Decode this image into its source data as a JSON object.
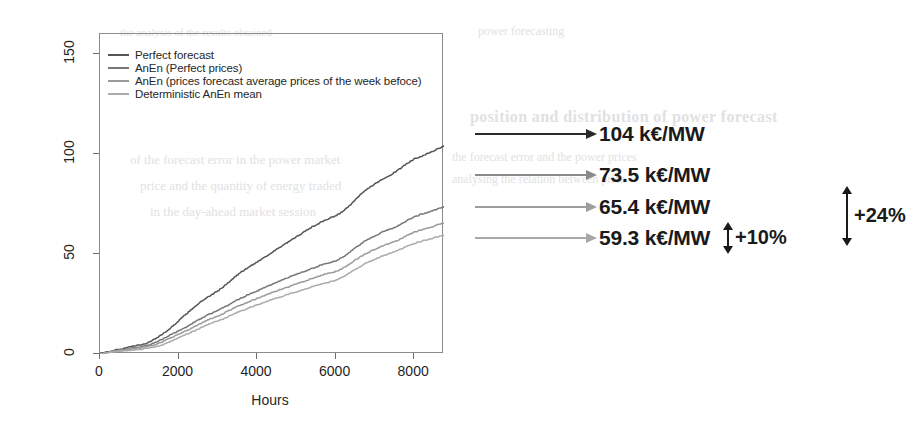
{
  "chart_data": {
    "type": "line",
    "title": "",
    "xlabel": "Hours",
    "ylabel": "Income (K€/MW)",
    "xlim": [
      0,
      8760
    ],
    "ylim": [
      0,
      160
    ],
    "xticks": [
      0,
      2000,
      4000,
      6000,
      8000
    ],
    "yticks": [
      0,
      50,
      100,
      150
    ],
    "xtick_labels": [
      "0",
      "2000",
      "4000",
      "6000",
      "8000"
    ],
    "ytick_labels": [
      "0",
      "50",
      "100",
      "150"
    ],
    "grid": false,
    "legend_position": "top-left",
    "series": [
      {
        "name": "Perfect forecast",
        "color": "#555555",
        "final_value": 104,
        "x": [
          0,
          200,
          400,
          600,
          800,
          1000,
          1200,
          1400,
          1600,
          1800,
          2000,
          2200,
          2400,
          2600,
          2800,
          3000,
          3200,
          3400,
          3600,
          3800,
          4000,
          4200,
          4400,
          4600,
          4800,
          5000,
          5200,
          5400,
          5600,
          5800,
          6000,
          6200,
          6400,
          6600,
          6800,
          7000,
          7200,
          7400,
          7600,
          7800,
          8000,
          8200,
          8400,
          8600,
          8760
        ],
        "values": [
          0,
          1.0,
          2.0,
          2.8,
          3.6,
          4.4,
          5.4,
          7.5,
          10.0,
          13.0,
          16.5,
          20.0,
          23.5,
          26.5,
          29.0,
          31.5,
          34.5,
          38.0,
          41.0,
          43.5,
          46.0,
          48.5,
          51.0,
          53.5,
          56.0,
          58.5,
          61.0,
          63.5,
          65.5,
          67.5,
          69.0,
          71.5,
          75.0,
          79.0,
          82.5,
          85.0,
          87.5,
          89.5,
          92.0,
          95.0,
          97.5,
          99.0,
          100.5,
          102.5,
          104
        ]
      },
      {
        "name": "AnEn (Perfect prices)",
        "color": "#777777",
        "final_value": 73.5,
        "x": [
          0,
          200,
          400,
          600,
          800,
          1000,
          1200,
          1400,
          1600,
          1800,
          2000,
          2200,
          2400,
          2600,
          2800,
          3000,
          3200,
          3400,
          3600,
          3800,
          4000,
          4200,
          4400,
          4600,
          4800,
          5000,
          5200,
          5400,
          5600,
          5800,
          6000,
          6200,
          6400,
          6600,
          6800,
          7000,
          7200,
          7400,
          7600,
          7800,
          8000,
          8200,
          8400,
          8600,
          8760
        ],
        "values": [
          0,
          0.8,
          1.6,
          2.2,
          2.8,
          3.4,
          4.2,
          5.5,
          7.5,
          9.5,
          11.5,
          13.5,
          15.8,
          18.0,
          20.0,
          21.8,
          23.8,
          26.0,
          28.0,
          29.8,
          31.5,
          33.2,
          35.0,
          36.6,
          38.2,
          39.8,
          41.2,
          42.8,
          44.2,
          45.5,
          46.5,
          48.5,
          51.5,
          54.5,
          57.0,
          59.0,
          61.0,
          62.5,
          64.2,
          66.5,
          68.5,
          70.0,
          71.0,
          72.5,
          73.5
        ]
      },
      {
        "name": "AnEn (prices forecast average prices of the week befoce)",
        "color": "#9a9a9a",
        "final_value": 65.4,
        "x": [
          0,
          200,
          400,
          600,
          800,
          1000,
          1200,
          1400,
          1600,
          1800,
          2000,
          2200,
          2400,
          2600,
          2800,
          3000,
          3200,
          3400,
          3600,
          3800,
          4000,
          4200,
          4400,
          4600,
          4800,
          5000,
          5200,
          5400,
          5600,
          5800,
          6000,
          6200,
          6400,
          6600,
          6800,
          7000,
          7200,
          7400,
          7600,
          7800,
          8000,
          8200,
          8400,
          8600,
          8760
        ],
        "values": [
          0,
          0.7,
          1.4,
          1.9,
          2.4,
          2.9,
          3.6,
          4.6,
          6.2,
          8.0,
          9.8,
          11.6,
          13.6,
          15.6,
          17.4,
          19.0,
          20.8,
          22.8,
          24.6,
          26.2,
          27.8,
          29.3,
          30.8,
          32.2,
          33.6,
          35.0,
          36.3,
          37.7,
          39.0,
          40.2,
          41.2,
          43.0,
          45.6,
          48.2,
          50.4,
          52.2,
          54.0,
          55.4,
          57.0,
          59.0,
          60.8,
          62.2,
          63.2,
          64.6,
          65.4
        ]
      },
      {
        "name": "Deterministic AnEn mean",
        "color": "#ababab",
        "final_value": 59.3,
        "x": [
          0,
          200,
          400,
          600,
          800,
          1000,
          1200,
          1400,
          1600,
          1800,
          2000,
          2200,
          2400,
          2600,
          2800,
          3000,
          3200,
          3400,
          3600,
          3800,
          4000,
          4200,
          4400,
          4600,
          4800,
          5000,
          5200,
          5400,
          5600,
          5800,
          6000,
          6200,
          6400,
          6600,
          6800,
          7000,
          7200,
          7400,
          7600,
          7800,
          8000,
          8200,
          8400,
          8600,
          8760
        ],
        "values": [
          0,
          0.5,
          1.0,
          1.4,
          1.8,
          2.2,
          2.7,
          3.4,
          4.6,
          6.2,
          8.0,
          9.8,
          11.6,
          13.4,
          15.0,
          16.5,
          18.1,
          19.9,
          21.5,
          23.0,
          24.5,
          25.9,
          27.2,
          28.5,
          29.8,
          31.0,
          32.2,
          33.5,
          34.7,
          35.8,
          36.8,
          38.5,
          41.0,
          43.5,
          45.6,
          47.3,
          49.0,
          50.3,
          51.8,
          53.6,
          55.2,
          56.5,
          57.4,
          58.6,
          59.3
        ]
      }
    ]
  },
  "legend": {
    "items": [
      {
        "label": "Perfect forecast",
        "color": "#555555"
      },
      {
        "label": "AnEn (Perfect prices)",
        "color": "#777777"
      },
      {
        "label": "AnEn (prices forecast average prices of the week befoce)",
        "color": "#9a9a9a"
      },
      {
        "label": "Deterministic AnEn mean",
        "color": "#ababab"
      }
    ]
  },
  "axes": {
    "ylabel": "Income (K€/MW)",
    "xlabel": "Hours",
    "xtick_labels": [
      "0",
      "2000",
      "4000",
      "6000",
      "8000"
    ],
    "ytick_labels": [
      "0",
      "50",
      "100",
      "150"
    ]
  },
  "annotations": {
    "rows": [
      {
        "value": "104  k€/MW",
        "color": "#2a2a2a"
      },
      {
        "value": "73.5 k€/MW",
        "color": "#7b7b7b"
      },
      {
        "value": "65.4 k€/MW",
        "color": "#9a9a9a"
      },
      {
        "value": "59.3 k€/MW",
        "color": "#a8a8a8"
      }
    ],
    "delta_small": "+10%",
    "delta_large": "+24%"
  },
  "bleed_text": {
    "b1": "position and distribution of power forecast",
    "b2": "the forecast error and the power prices",
    "b3": "analysing the relation between price",
    "b4": "of the forecast error in the power market",
    "b5": "price and the quantity of energy traded",
    "b6": "in the day-ahead market session",
    "b7": "power forecasting",
    "b8": "the analysis of the results obtained"
  }
}
